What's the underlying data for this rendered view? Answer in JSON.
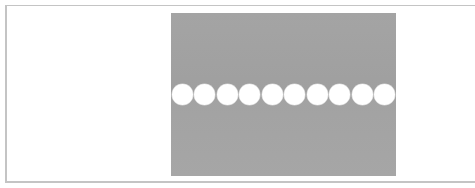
{
  "figure": {
    "background_color": "#ffffff",
    "frame_color": "#c4c4c4",
    "panel_color": "#a3a3a3",
    "dot_color": "#ffffff",
    "dots": [
      {
        "index": 1
      },
      {
        "index": 2
      },
      {
        "index": 3
      },
      {
        "index": 4
      },
      {
        "index": 5
      },
      {
        "index": 6
      },
      {
        "index": 7
      },
      {
        "index": 8
      },
      {
        "index": 9
      },
      {
        "index": 10
      }
    ],
    "dot_count": 10
  }
}
